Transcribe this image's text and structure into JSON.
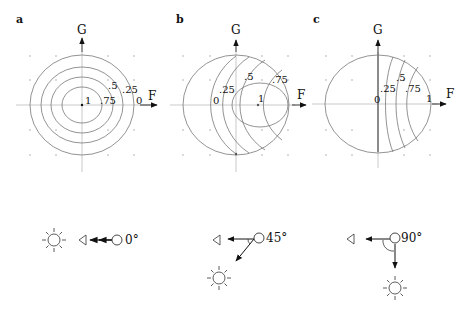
{
  "figure": {
    "panels": [
      {
        "id": "a",
        "label": "a",
        "x_axis": "F",
        "y_axis": "G",
        "contour_labels": [
          "1",
          ".75",
          ".5",
          ".25",
          "0"
        ],
        "angle_label": "0°",
        "angle_deg": 0
      },
      {
        "id": "b",
        "label": "b",
        "x_axis": "F",
        "y_axis": "G",
        "contour_labels": [
          "0",
          ".25",
          ".5",
          ".75",
          "1"
        ],
        "angle_label": "45°",
        "angle_deg": 45
      },
      {
        "id": "c",
        "label": "c",
        "x_axis": "F",
        "y_axis": "G",
        "contour_labels": [
          "0",
          ".25",
          ".5",
          ".75",
          "1"
        ],
        "angle_label": "90°",
        "angle_deg": 90
      }
    ],
    "icons": {
      "light_source": "sun-icon",
      "viewer": "eye-icon",
      "object": "sphere-icon"
    }
  }
}
